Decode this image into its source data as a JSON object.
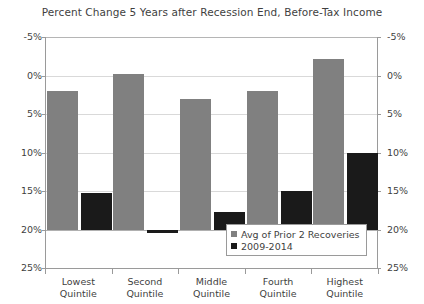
{
  "chart_data": {
    "type": "bar",
    "title": "Percent Change 5 Years after Recession End, Before-Tax Income",
    "xlabel": "",
    "ylabel": "",
    "ylim": [
      -5,
      25
    ],
    "yticks": [
      "-5%",
      "0%",
      "5%",
      "10%",
      "15%",
      "20%",
      "25%"
    ],
    "ytick_values": [
      -5,
      0,
      5,
      10,
      15,
      20,
      25
    ],
    "grid": true,
    "legend_position": "inside-bottom-right",
    "dual_y_axis": true,
    "categories": [
      "Lowest Quintile",
      "Second Quintile",
      "Middle Quintile",
      "Fourth Quintile",
      "Highest Quintile"
    ],
    "category_lines": [
      [
        "Lowest",
        "Quintile"
      ],
      [
        "Second",
        "Quintile"
      ],
      [
        "Middle",
        "Quintile"
      ],
      [
        "Fourth",
        "Quintile"
      ],
      [
        "Highest",
        "Quintile"
      ]
    ],
    "series": [
      {
        "name": "Avg of Prior 2 Recoveries",
        "color": "#808080",
        "values": [
          18.0,
          20.2,
          17.0,
          18.0,
          22.1
        ]
      },
      {
        "name": "2009-2014",
        "color": "#1a1a1a",
        "values": [
          4.8,
          -0.5,
          2.3,
          5.0,
          9.9
        ]
      }
    ]
  },
  "legend": {
    "items": [
      {
        "label": "Avg of Prior 2 Recoveries",
        "swatch": "prior"
      },
      {
        "label": "2009-2014",
        "swatch": "recent"
      }
    ]
  },
  "axis": {
    "left_labels": [
      "25%",
      "20%",
      "15%",
      "10%",
      "5%",
      "0%",
      "-5%"
    ],
    "right_labels": [
      "25%",
      "20%",
      "15%",
      "10%",
      "5%",
      "0%",
      "-5%"
    ]
  }
}
